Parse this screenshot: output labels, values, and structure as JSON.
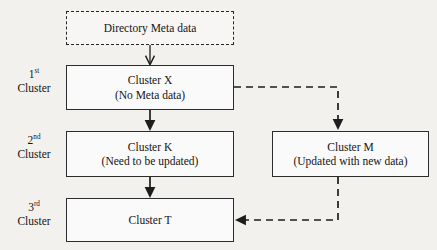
{
  "diagram": {
    "background_color": "#f2f1ee",
    "stroke_color": "#2c2c2c",
    "nodes": [
      {
        "id": "directory-meta-data",
        "title": "Directory Meta data",
        "subtitle": "",
        "border_style": "dash-dot"
      },
      {
        "id": "cluster-x",
        "title": "Cluster X",
        "subtitle": "(No Meta data)",
        "border_style": "solid"
      },
      {
        "id": "cluster-k",
        "title": "Cluster K",
        "subtitle": "(Need to be updated)",
        "border_style": "solid"
      },
      {
        "id": "cluster-t",
        "title": "Cluster T",
        "subtitle": "",
        "border_style": "solid"
      },
      {
        "id": "cluster-m",
        "title": "Cluster M",
        "subtitle": "(Updated with new data)",
        "border_style": "solid"
      }
    ],
    "side_labels": [
      {
        "ordinal": "1",
        "suffix": "st",
        "word": "Cluster"
      },
      {
        "ordinal": "2",
        "suffix": "nd",
        "word": "Cluster"
      },
      {
        "ordinal": "3",
        "suffix": "rd",
        "word": "Cluster"
      }
    ],
    "connectors": [
      {
        "id": "meta-to-x",
        "from": "directory-meta-data",
        "to": "cluster-x",
        "style": "solid",
        "arrowhead": "open"
      },
      {
        "id": "x-to-k",
        "from": "cluster-x",
        "to": "cluster-k",
        "style": "solid",
        "arrowhead": "filled"
      },
      {
        "id": "k-to-t",
        "from": "cluster-k",
        "to": "cluster-t",
        "style": "solid",
        "arrowhead": "filled"
      },
      {
        "id": "x-to-m",
        "from": "cluster-x",
        "to": "cluster-m",
        "style": "dashed",
        "arrowhead": "filled"
      },
      {
        "id": "m-to-t",
        "from": "cluster-m",
        "to": "cluster-t",
        "style": "dashed",
        "arrowhead": "filled"
      }
    ]
  }
}
